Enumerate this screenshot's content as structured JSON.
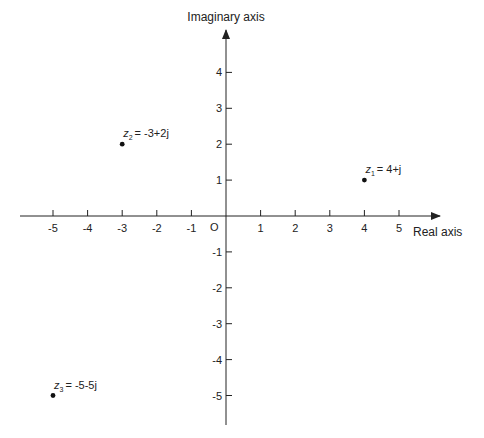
{
  "chart_data": {
    "type": "scatter",
    "xlabel": "Real axis",
    "ylabel": "Imaginary axis",
    "origin_label": "O",
    "xlim": [
      -6,
      6
    ],
    "ylim": [
      -6,
      5
    ],
    "grid": false,
    "x_ticks": [
      -5,
      -4,
      -3,
      -2,
      -1,
      1,
      2,
      3,
      4,
      5
    ],
    "y_ticks": [
      4,
      3,
      2,
      1,
      -1,
      -2,
      -3,
      -4,
      -5
    ],
    "points": [
      {
        "name": "z1",
        "sub": "1",
        "label": "= 4+j",
        "x": 4,
        "y": 1
      },
      {
        "name": "z2",
        "sub": "2",
        "label": "= -3+2j",
        "x": -3,
        "y": 2
      },
      {
        "name": "z3",
        "sub": "3",
        "label": "= -5-5j",
        "x": -5,
        "y": -5
      }
    ]
  },
  "colors": {
    "ink": "#222222",
    "background": "#ffffff"
  }
}
